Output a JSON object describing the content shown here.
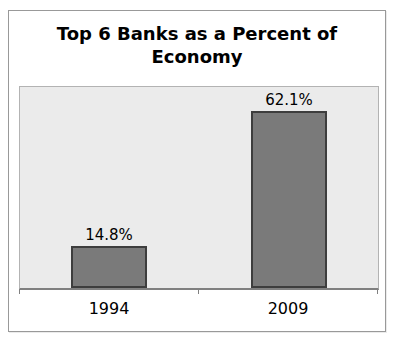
{
  "chart_data": {
    "type": "bar",
    "title": "Top 6 Banks as a Percent of Economy",
    "categories": [
      "1994",
      "2009"
    ],
    "values": [
      14.8,
      62.1
    ],
    "value_labels": [
      "14.8%",
      "62.1%"
    ],
    "xlabel": "",
    "ylabel": "",
    "ylim": [
      0,
      70
    ],
    "grid": false,
    "legend": false,
    "colors": {
      "bar_fill": "#7a7a7a",
      "bar_border": "#3d3d3d",
      "plot_background": "#ebebeb",
      "frame_border": "#999999",
      "axis_line": "#808080",
      "text": "#000000"
    }
  }
}
